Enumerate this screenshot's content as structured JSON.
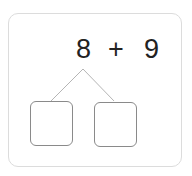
{
  "problem": {
    "left_operand": "8",
    "operator": "+",
    "right_operand": "9"
  },
  "number_bond": {
    "boxes": [
      {
        "value": ""
      },
      {
        "value": ""
      }
    ]
  },
  "colors": {
    "text": "#222222",
    "card_border": "#dcdcdc",
    "box_border": "#8a8a8a",
    "line": "#b5b5b5"
  }
}
